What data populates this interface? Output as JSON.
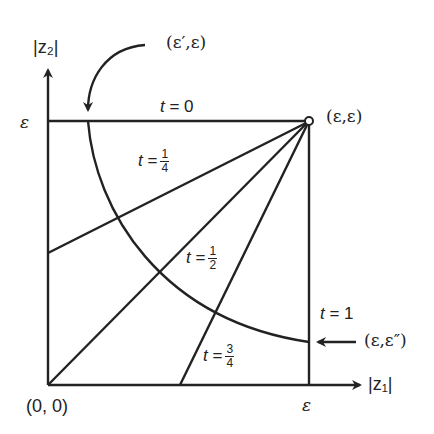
{
  "diagram": {
    "axes": {
      "x_label": "|z₁|",
      "y_label": "|z₂|",
      "origin_label": "(0, 0)",
      "x_tick_label": "ε",
      "y_tick_label": "ε"
    },
    "points": {
      "corner": "(ε,ε)",
      "arc_top": "(ε′,ε)",
      "arc_right": "(ε,ε″)"
    },
    "curves": [
      {
        "t_label": "t = 0",
        "t_var": "t",
        "value": "0"
      },
      {
        "t_label": "t = 1/4",
        "t_var": "t",
        "num": "1",
        "den": "4"
      },
      {
        "t_label": "t = 1/2",
        "t_var": "t",
        "num": "1",
        "den": "2"
      },
      {
        "t_label": "t = 3/4",
        "t_var": "t",
        "num": "3",
        "den": "4"
      },
      {
        "t_label": "t = 1",
        "t_var": "t",
        "value": "1"
      }
    ],
    "colors": {
      "ink": "#222222",
      "background": "#ffffff"
    }
  }
}
